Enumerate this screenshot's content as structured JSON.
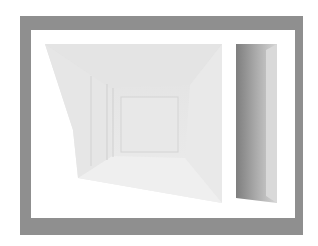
{
  "artwork": {
    "description": "Framed grayscale rendering of two perspective box interiors",
    "colors": {
      "frame": "#8f8f8f",
      "mat": "#ffffff",
      "left_panel_light": "#ececec",
      "left_panel_mid": "#dedede",
      "right_panel_dark": "#8a8a8a",
      "right_panel_light": "#d8d8d8"
    },
    "panels": [
      {
        "name": "left-corridor-view",
        "inner_square": [
          121,
          97,
          57,
          55
        ]
      },
      {
        "name": "right-narrow-box"
      }
    ]
  }
}
